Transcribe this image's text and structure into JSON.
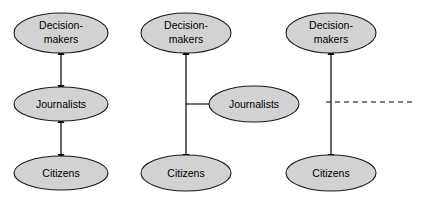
{
  "diagram": {
    "background_color": "#ffffff",
    "node_fill_color": "#d2d2d2",
    "node_stroke_color": "#1a1a1a",
    "edge_color": "#000000",
    "labels": {
      "decision_makers": "Decision-\nmakers",
      "decision_makers_line1": "Decision-",
      "decision_makers_line2": "makers",
      "journalists": "Journalists",
      "citizens": "Citizens"
    },
    "panels": [
      {
        "id": "panel-left",
        "name": "chain-model",
        "nodes": [
          {
            "id": "p1-decision-makers",
            "label_line1": "Decision-",
            "label_line2": "makers",
            "cx": 61,
            "cy": 33,
            "rx": 47,
            "ry": 20
          },
          {
            "id": "p1-journalists",
            "label_line1": "Journalists",
            "label_line2": "",
            "cx": 61,
            "cy": 104,
            "rx": 47,
            "ry": 17
          },
          {
            "id": "p1-citizens",
            "label_line1": "Citizens",
            "label_line2": "",
            "cx": 61,
            "cy": 173,
            "rx": 47,
            "ry": 17
          }
        ],
        "edges": [
          {
            "id": "p1-edge-dm-jr",
            "style": "double-arrow",
            "x1": 61,
            "y1": 55,
            "x2": 61,
            "y2": 85
          },
          {
            "id": "p1-edge-jr-cz",
            "style": "double-arrow",
            "x1": 61,
            "y1": 123,
            "x2": 61,
            "y2": 154
          }
        ]
      },
      {
        "id": "panel-middle",
        "name": "mediator-model",
        "nodes": [
          {
            "id": "p2-decision-makers",
            "label_line1": "Decision-",
            "label_line2": "makers",
            "cx": 186,
            "cy": 33,
            "rx": 45,
            "ry": 20
          },
          {
            "id": "p2-journalists",
            "label_line1": "Journalists",
            "label_line2": "",
            "cx": 254,
            "cy": 104,
            "rx": 45,
            "ry": 18
          },
          {
            "id": "p2-citizens",
            "label_line1": "Citizens",
            "label_line2": "",
            "cx": 186,
            "cy": 173,
            "rx": 45,
            "ry": 18
          }
        ],
        "edges": [
          {
            "id": "p2-edge-dm-cz",
            "style": "double-arrow",
            "x1": 186,
            "y1": 55,
            "x2": 186,
            "y2": 154
          },
          {
            "id": "p2-edge-jr-link",
            "style": "plain",
            "x1": 186,
            "y1": 104,
            "x2": 209,
            "y2": 104
          }
        ]
      },
      {
        "id": "panel-right",
        "name": "direct-model",
        "nodes": [
          {
            "id": "p3-decision-makers",
            "label_line1": "Decision-",
            "label_line2": "makers",
            "cx": 331,
            "cy": 33,
            "rx": 45,
            "ry": 20
          },
          {
            "id": "p3-citizens",
            "label_line1": "Citizens",
            "label_line2": "",
            "cx": 331,
            "cy": 173,
            "rx": 45,
            "ry": 18
          }
        ],
        "edges": [
          {
            "id": "p3-edge-dm-cz",
            "style": "double-arrow",
            "x1": 331,
            "y1": 55,
            "x2": 331,
            "y2": 154
          },
          {
            "id": "p3-edge-dashed",
            "style": "dashed",
            "x1": 326,
            "y1": 102,
            "x2": 414,
            "y2": 102
          }
        ]
      }
    ]
  }
}
